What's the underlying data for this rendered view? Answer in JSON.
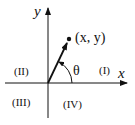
{
  "diagram": {
    "title": "",
    "axes": {
      "x_label": "x",
      "y_label": "y"
    },
    "point_label": "(x, y)",
    "angle_label": "θ",
    "quadrants": [
      {
        "id": "I",
        "label": "(I)"
      },
      {
        "id": "II",
        "label": "(II)"
      },
      {
        "id": "III",
        "label": "(III)"
      },
      {
        "id": "IV",
        "label": "(IV)"
      }
    ],
    "colors": {
      "ink": "#111111",
      "background": "#ffffff"
    }
  }
}
